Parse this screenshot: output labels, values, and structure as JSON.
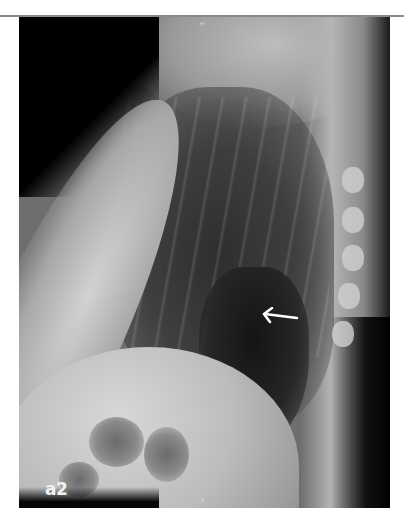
{
  "figure": {
    "panel_label": "a2",
    "markers": {
      "top": "H",
      "bottom": "F"
    },
    "annotation": {
      "type": "arrow",
      "direction": "left",
      "color": "#ffffff"
    },
    "colors": {
      "background": "#ffffff",
      "top_rule": "#8a8a8a",
      "label": "#f2f2f2"
    }
  }
}
